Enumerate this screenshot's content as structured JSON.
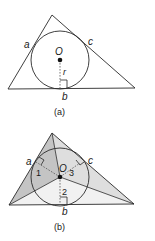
{
  "figure_a": {
    "caption": "(a)",
    "labels": {
      "side_a": "a",
      "side_b": "b",
      "side_c": "c",
      "center": "O",
      "radius": "r"
    },
    "triangle": {
      "apex": [
        52,
        15
      ],
      "bottom_left": [
        8,
        89
      ],
      "bottom_right": [
        135,
        88
      ]
    },
    "circle": {
      "cx": 60,
      "cy": 60,
      "r": 29
    }
  },
  "figure_b": {
    "caption": "(b)",
    "labels": {
      "side_a": "a",
      "side_b": "b",
      "side_c": "c",
      "center": "O",
      "region_1": "1",
      "region_2": "2",
      "region_3": "3"
    },
    "triangle": {
      "apex": [
        52,
        133
      ],
      "bottom_left": [
        9,
        205
      ],
      "bottom_right": [
        134,
        204
      ]
    },
    "circle": {
      "cx": 60,
      "cy": 177,
      "r": 29
    },
    "colors": {
      "region_left": "#c4c4c4",
      "region_right": "#dedede",
      "region_bottom": "#f1f1f1"
    }
  },
  "colors": {
    "stroke": "#2a2a2a",
    "dashed": "#555555",
    "text": "#1a1a1a"
  }
}
